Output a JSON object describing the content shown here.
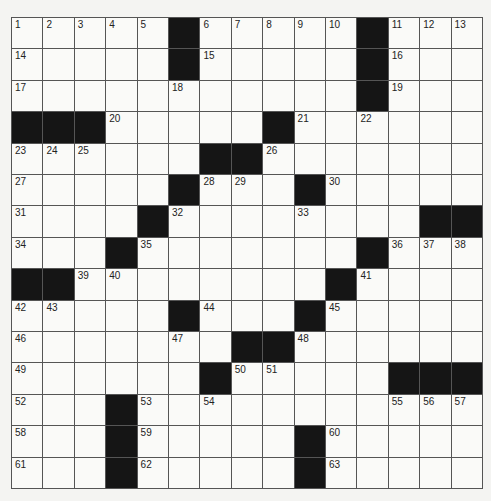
{
  "puzzle": {
    "size": 15,
    "grid": [
      ".....#.....#...",
      ".....#.....#...",
      "...........#...",
      "###.....#......",
      "......##.......",
      ".....#...#.....",
      "....#........##",
      "...#.......#...",
      "##........#....",
      ".....#...#.....",
      ".......##......",
      "......#.....###",
      "...#...........",
      "...#.....#.....",
      "...#.....#....."
    ],
    "numbers": [
      [
        1,
        2,
        3,
        4,
        5,
        0,
        6,
        7,
        8,
        9,
        10,
        0,
        11,
        12,
        13
      ],
      [
        14,
        0,
        0,
        0,
        0,
        0,
        15,
        0,
        0,
        0,
        0,
        0,
        16,
        0,
        0
      ],
      [
        17,
        0,
        0,
        0,
        0,
        18,
        0,
        0,
        0,
        0,
        0,
        0,
        19,
        0,
        0
      ],
      [
        0,
        0,
        0,
        20,
        0,
        0,
        0,
        0,
        0,
        21,
        0,
        22,
        0,
        0,
        0
      ],
      [
        23,
        24,
        25,
        0,
        0,
        0,
        0,
        0,
        26,
        0,
        0,
        0,
        0,
        0,
        0
      ],
      [
        27,
        0,
        0,
        0,
        0,
        0,
        28,
        29,
        0,
        0,
        30,
        0,
        0,
        0,
        0
      ],
      [
        31,
        0,
        0,
        0,
        0,
        32,
        0,
        0,
        0,
        33,
        0,
        0,
        0,
        0,
        0
      ],
      [
        34,
        0,
        0,
        0,
        35,
        0,
        0,
        0,
        0,
        0,
        0,
        0,
        36,
        37,
        38
      ],
      [
        0,
        0,
        39,
        40,
        0,
        0,
        0,
        0,
        0,
        0,
        0,
        41,
        0,
        0,
        0
      ],
      [
        42,
        43,
        0,
        0,
        0,
        0,
        44,
        0,
        0,
        0,
        45,
        0,
        0,
        0,
        0
      ],
      [
        46,
        0,
        0,
        0,
        0,
        47,
        0,
        0,
        0,
        48,
        0,
        0,
        0,
        0,
        0
      ],
      [
        49,
        0,
        0,
        0,
        0,
        0,
        0,
        50,
        51,
        0,
        0,
        0,
        0,
        0,
        0
      ],
      [
        52,
        0,
        0,
        0,
        53,
        0,
        54,
        0,
        0,
        0,
        0,
        0,
        55,
        56,
        57
      ],
      [
        58,
        0,
        0,
        0,
        59,
        0,
        0,
        0,
        0,
        0,
        60,
        0,
        0,
        0,
        0
      ],
      [
        61,
        0,
        0,
        0,
        62,
        0,
        0,
        0,
        0,
        0,
        63,
        0,
        0,
        0,
        0
      ]
    ]
  }
}
